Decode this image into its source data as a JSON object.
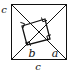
{
  "figure": {
    "kind": "geometry-diagram",
    "background_color": "#ffffff",
    "stroke_color": "#111111",
    "outer_square": {
      "name": "outer-square",
      "left": 11,
      "top": 4,
      "right": 67,
      "bottom": 60
    },
    "inner_square": {
      "name": "inner-tilted-square",
      "vertices": [
        {
          "label": "top-left-vertex",
          "x": 22,
          "y": 26
        },
        {
          "label": "top-right-vertex",
          "x": 45,
          "y": 19
        },
        {
          "label": "bottom-right-vertex",
          "x": 50,
          "y": 39
        },
        {
          "label": "bottom-left-vertex",
          "x": 27,
          "y": 45
        }
      ]
    },
    "right_angle_marks": [
      {
        "name": "right-angle-mark-top-left",
        "x": 22,
        "y": 26
      },
      {
        "name": "right-angle-mark-top-right",
        "x": 45,
        "y": 19
      },
      {
        "name": "right-angle-mark-bottom-right",
        "x": 50,
        "y": 39
      },
      {
        "name": "right-angle-mark-bottom-left",
        "x": 27,
        "y": 45
      }
    ],
    "diagonals": [
      {
        "name": "diagonal-top-left-to-bottom-right",
        "x1": 11,
        "y1": 4,
        "x2": 67,
        "y2": 60
      },
      {
        "name": "diagonal-top-right-to-bottom-left",
        "x1": 67,
        "y1": 4,
        "x2": 11,
        "y2": 60
      }
    ],
    "labels": [
      {
        "name": "label-a",
        "text": "a",
        "x": 57,
        "y": 55
      },
      {
        "name": "label-b",
        "text": "b",
        "x": 32,
        "y": 56
      },
      {
        "name": "label-c-left",
        "text": "c",
        "x": 3,
        "y": 13
      },
      {
        "name": "label-c-bottom",
        "text": "c",
        "x": 37,
        "y": 70
      }
    ]
  }
}
